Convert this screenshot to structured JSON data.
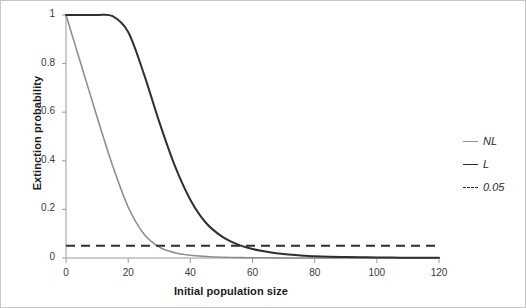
{
  "chart_data": {
    "type": "line",
    "title": "",
    "xlabel": "Initial population size",
    "ylabel": "Extinction probability",
    "xlim": [
      0,
      120
    ],
    "ylim": [
      0,
      1
    ],
    "xticks": [
      "0",
      "20",
      "40",
      "60",
      "80",
      "100",
      "120"
    ],
    "xtick_values": [
      0,
      20,
      40,
      60,
      80,
      100,
      120
    ],
    "yticks": [
      "0",
      "0.2",
      "0.4",
      "0.6",
      "0.8",
      "1"
    ],
    "ytick_values": [
      0,
      0.2,
      0.4,
      0.6,
      0.8,
      1
    ],
    "grid": false,
    "legend_position": "right",
    "x": [
      0,
      5,
      10,
      15,
      20,
      25,
      30,
      35,
      40,
      45,
      50,
      55,
      60,
      65,
      70,
      75,
      80,
      85,
      90,
      95,
      100,
      105,
      110,
      115,
      120
    ],
    "series": [
      {
        "name": "NL",
        "color": "#8e8e8e",
        "style": "solid",
        "values": [
          1.0,
          0.79,
          0.58,
          0.38,
          0.21,
          0.1,
          0.045,
          0.022,
          0.011,
          0.006,
          0.003,
          0.002,
          0.001,
          0.001,
          0.0,
          0.0,
          0.0,
          0.0,
          0.0,
          0.0,
          0.0,
          0.0,
          0.0,
          0.0,
          0.0
        ]
      },
      {
        "name": "L",
        "color": "#2f2f2f",
        "style": "solid",
        "values": [
          1.0,
          1.0,
          1.0,
          0.995,
          0.93,
          0.76,
          0.56,
          0.38,
          0.24,
          0.145,
          0.09,
          0.057,
          0.037,
          0.025,
          0.016,
          0.011,
          0.007,
          0.005,
          0.004,
          0.003,
          0.002,
          0.002,
          0.001,
          0.001,
          0.001
        ]
      },
      {
        "name": "0.05",
        "color": "#2f2f2f",
        "style": "dashed",
        "constant": 0.05,
        "values": [
          0.05,
          0.05,
          0.05,
          0.05,
          0.05,
          0.05,
          0.05,
          0.05,
          0.05,
          0.05,
          0.05,
          0.05,
          0.05,
          0.05,
          0.05,
          0.05,
          0.05,
          0.05,
          0.05,
          0.05,
          0.05,
          0.05,
          0.05,
          0.05,
          0.05
        ]
      }
    ],
    "annotations": [
      {
        "text": "NL crosses 0.05 threshold near initial population size 27"
      },
      {
        "text": "L crosses 0.05 threshold near initial population size 56"
      }
    ]
  },
  "legend": {
    "items": [
      {
        "label": "NL"
      },
      {
        "label": "L"
      },
      {
        "label": "0.05"
      }
    ]
  },
  "colors": {
    "nl_line": "#8e8e8e",
    "l_line": "#2f2f2f",
    "threshold_line": "#2f2f2f",
    "axis": "#9a9a9a",
    "text": "#1a1a1a",
    "border": "#c8c8c8"
  }
}
